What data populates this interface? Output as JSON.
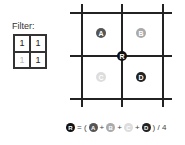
{
  "filter": {
    "label": "Filter:",
    "cells": [
      {
        "value": "1",
        "dim": false
      },
      {
        "value": "1",
        "dim": false
      },
      {
        "value": "1",
        "dim": true
      },
      {
        "value": "1",
        "dim": false
      }
    ]
  },
  "grid": {
    "points": [
      {
        "letter": "A",
        "color": "#555555"
      },
      {
        "letter": "B",
        "color": "#aaaaaa"
      },
      {
        "letter": "C",
        "color": "#dddddd"
      },
      {
        "letter": "D",
        "color": "#222222"
      },
      {
        "letter": "R",
        "color": "#111111"
      }
    ]
  },
  "formula": {
    "equals": "= (",
    "plus": "+",
    "tail": ") / 4"
  }
}
